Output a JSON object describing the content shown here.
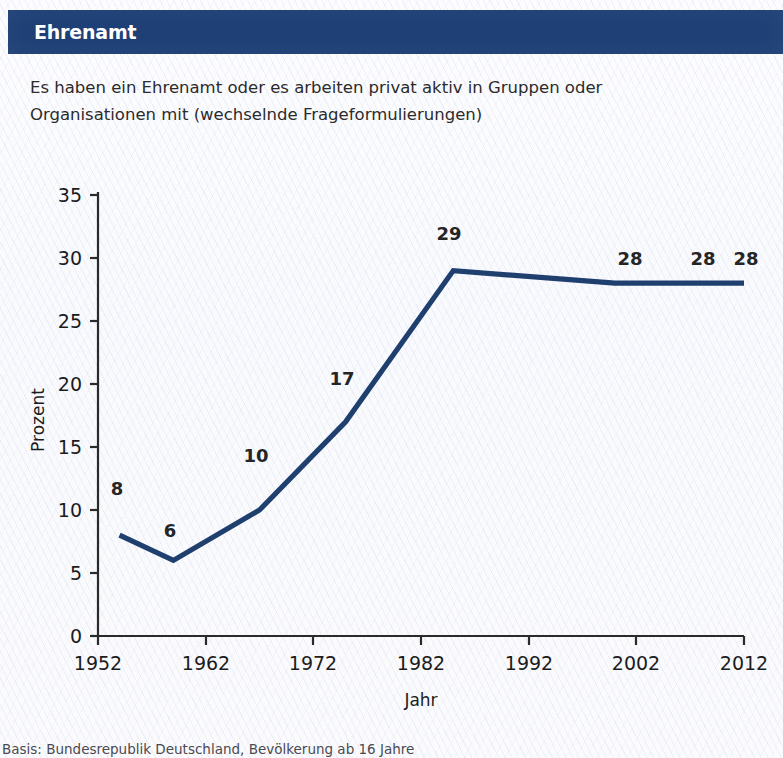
{
  "header": {
    "title": "Ehrenamt",
    "bar_color": "#1e4076"
  },
  "subtitle": {
    "line1": "Es haben ein Ehrenamt oder es arbeiten privat aktiv in Gruppen oder",
    "line2": "Organisationen mit (wechselnde Frageformulierungen)"
  },
  "footnote": {
    "text": "Basis: Bundesrepublik Deutschland, Bevölkerung ab 16 Jahre"
  },
  "chart_data": {
    "type": "line",
    "title": "",
    "xlabel": "Jahr",
    "ylabel": "Prozent",
    "xlim": [
      1952,
      2012
    ],
    "ylim": [
      0,
      35
    ],
    "grid": false,
    "legend": "none",
    "line_color": "#1f3f6e",
    "x_ticks": [
      1952,
      1962,
      1972,
      1982,
      1992,
      2002,
      2012
    ],
    "y_ticks": [
      0,
      5,
      10,
      15,
      20,
      25,
      30,
      35
    ],
    "x": [
      1954,
      1959,
      1967,
      1975,
      1985,
      2000,
      2008,
      2012
    ],
    "values": [
      8,
      6,
      10,
      17,
      29,
      28,
      28,
      28
    ],
    "point_labels": [
      "8",
      "6",
      "10",
      "17",
      "29",
      "28",
      "28",
      "28"
    ],
    "series": [
      {
        "name": "Ehrenamt / privat aktiv in Gruppen oder Organisationen",
        "values": [
          8,
          6,
          10,
          17,
          29,
          28,
          28,
          28
        ]
      }
    ]
  }
}
